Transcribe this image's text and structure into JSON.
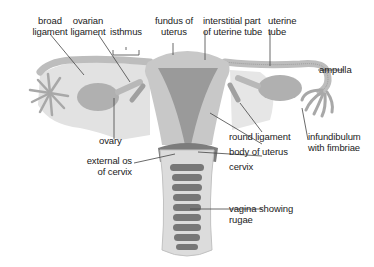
{
  "colors": {
    "tissue_light": "#d8d8d8",
    "tissue_mid": "#b5b5b5",
    "tissue_dark": "#8a8a8a",
    "rugae": "#6f6f6f",
    "leader_line": "#444444",
    "text": "#222222"
  },
  "labels": {
    "broad_ligament": "broad\nligament",
    "ovarian_ligament": "ovarian\nligament",
    "isthmus": "isthmus",
    "fundus_of_uterus": "fundus of\nuterus",
    "interstitial_part": "interstitial part\nof uterine tube",
    "uterine_tube": "uterine\ntube",
    "ampulla": "ampulla",
    "ovary": "ovary",
    "round_ligament": "round ligament",
    "infundibulum": "infundibulum\nwith fimbriae",
    "external_os": "external os\nof cervix",
    "body_of_uterus": "body of uterus",
    "cervix": "cervix",
    "vagina": "vagina showing\nrugae"
  }
}
